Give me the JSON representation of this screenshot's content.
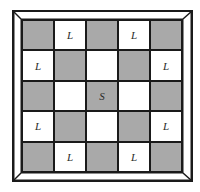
{
  "board": {
    "rows": 5,
    "cols": 5,
    "colors": {
      "shaded": "#a9a9a9",
      "plain": "#ffffff",
      "line": "#1a1a1a"
    },
    "cells": [
      [
        {
          "shade": "gray",
          "label": ""
        },
        {
          "shade": "white",
          "label": "L"
        },
        {
          "shade": "gray",
          "label": ""
        },
        {
          "shade": "white",
          "label": "L"
        },
        {
          "shade": "gray",
          "label": ""
        }
      ],
      [
        {
          "shade": "white",
          "label": "L"
        },
        {
          "shade": "gray",
          "label": ""
        },
        {
          "shade": "white",
          "label": ""
        },
        {
          "shade": "gray",
          "label": ""
        },
        {
          "shade": "white",
          "label": "L"
        }
      ],
      [
        {
          "shade": "gray",
          "label": ""
        },
        {
          "shade": "white",
          "label": ""
        },
        {
          "shade": "gray",
          "label": "S"
        },
        {
          "shade": "white",
          "label": ""
        },
        {
          "shade": "gray",
          "label": ""
        }
      ],
      [
        {
          "shade": "white",
          "label": "L"
        },
        {
          "shade": "gray",
          "label": ""
        },
        {
          "shade": "white",
          "label": ""
        },
        {
          "shade": "gray",
          "label": ""
        },
        {
          "shade": "white",
          "label": "L"
        }
      ],
      [
        {
          "shade": "gray",
          "label": ""
        },
        {
          "shade": "white",
          "label": "L"
        },
        {
          "shade": "gray",
          "label": ""
        },
        {
          "shade": "white",
          "label": "L"
        },
        {
          "shade": "gray",
          "label": ""
        }
      ]
    ]
  }
}
